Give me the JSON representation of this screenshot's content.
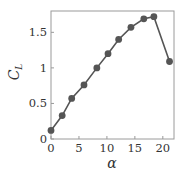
{
  "chart_data": {
    "type": "line",
    "title": "",
    "xlabel": "α",
    "ylabel": "C_L",
    "ylabel_main": "C",
    "ylabel_sub": "L",
    "x": [
      0,
      2,
      3.7,
      5.9,
      8.2,
      10.2,
      12.1,
      14.3,
      16.6,
      18.4,
      21.2
    ],
    "series": [
      {
        "name": "C_L",
        "values": [
          0.12,
          0.33,
          0.57,
          0.76,
          1.0,
          1.2,
          1.4,
          1.57,
          1.69,
          1.72,
          1.09
        ]
      }
    ],
    "xlim": [
      0,
      22
    ],
    "ylim": [
      0,
      1.8
    ],
    "xticks": [
      0,
      5,
      10,
      15,
      20
    ],
    "xtick_labels": [
      "0",
      "5",
      "10",
      "15",
      "20"
    ],
    "yticks": [
      0,
      0.5,
      1,
      1.5
    ],
    "ytick_labels": [
      "0",
      "0.5",
      "1",
      "1.5"
    ],
    "grid": false,
    "legend": null,
    "marker": "circle",
    "colors": {
      "series": "#555555",
      "axes": "#9a9a9a",
      "text": "#333333"
    }
  }
}
